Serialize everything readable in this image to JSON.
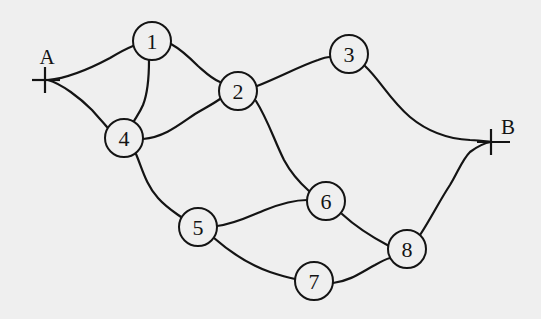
{
  "diagram": {
    "type": "network-graph",
    "background": "#efefef",
    "stroke_color": "#141414",
    "terminals": [
      {
        "id": "A",
        "label": "A",
        "x": 45,
        "y": 80,
        "label_x": 47,
        "label_y": 57
      },
      {
        "id": "B",
        "label": "B",
        "x": 491,
        "y": 142,
        "label_x": 508,
        "label_y": 127
      }
    ],
    "nodes": [
      {
        "id": "1",
        "label": "1",
        "x": 152,
        "y": 41
      },
      {
        "id": "2",
        "label": "2",
        "x": 238,
        "y": 91
      },
      {
        "id": "3",
        "label": "3",
        "x": 349,
        "y": 54
      },
      {
        "id": "4",
        "label": "4",
        "x": 124,
        "y": 138
      },
      {
        "id": "5",
        "label": "5",
        "x": 198,
        "y": 227
      },
      {
        "id": "6",
        "label": "6",
        "x": 326,
        "y": 201
      },
      {
        "id": "7",
        "label": "7",
        "x": 314,
        "y": 281
      },
      {
        "id": "8",
        "label": "8",
        "x": 407,
        "y": 249
      }
    ],
    "edges": [
      {
        "from": "A",
        "to": "1"
      },
      {
        "from": "A",
        "to": "4"
      },
      {
        "from": "1",
        "to": "4"
      },
      {
        "from": "1",
        "to": "2"
      },
      {
        "from": "4",
        "to": "2"
      },
      {
        "from": "4",
        "to": "5"
      },
      {
        "from": "2",
        "to": "3"
      },
      {
        "from": "2",
        "to": "6"
      },
      {
        "from": "3",
        "to": "B"
      },
      {
        "from": "5",
        "to": "6"
      },
      {
        "from": "5",
        "to": "7"
      },
      {
        "from": "6",
        "to": "8"
      },
      {
        "from": "7",
        "to": "8"
      },
      {
        "from": "8",
        "to": "B"
      }
    ]
  }
}
